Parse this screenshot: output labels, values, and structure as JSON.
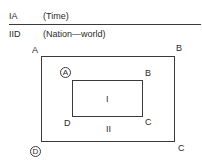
{
  "header": {
    "row1": {
      "code": "IA",
      "label": "(Time)"
    },
    "row2": {
      "code": "IID",
      "label": "(Nation—world)"
    }
  },
  "diagram": {
    "outer": {
      "top_left": "A",
      "top_right": "B",
      "bottom_right": "C",
      "bottom_left_circled": "D"
    },
    "inner": {
      "top_left_circled": "A",
      "top_right": "B",
      "bottom_right": "C",
      "bottom_left": "D"
    },
    "region_inner": "I",
    "region_outer": "II"
  }
}
